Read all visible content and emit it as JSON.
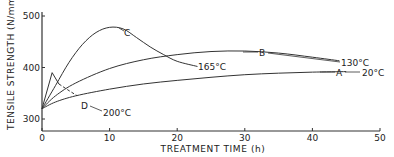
{
  "chart_data": {
    "type": "line",
    "title": "",
    "xlabel": "TREATMENT TIME (h)",
    "ylabel": "TENSILE STRENGTH (N/mm²)",
    "xlim": [
      0,
      50
    ],
    "ylim": [
      275,
      510
    ],
    "x_ticks": [
      0,
      10,
      20,
      30,
      40,
      50
    ],
    "x_tick_labels": [
      "0",
      "10",
      "20",
      "30",
      "40",
      "50"
    ],
    "y_ticks": [
      300,
      400,
      500
    ],
    "y_tick_labels": [
      "300",
      "400",
      "500"
    ],
    "grid": false,
    "legend": "inline labels",
    "series": [
      {
        "name": "A",
        "condition": "20°C",
        "style": "solid",
        "x": [
          0,
          2,
          5,
          10,
          15,
          20,
          25,
          30,
          35,
          40,
          45
        ],
        "y": [
          320,
          333,
          345,
          358,
          368,
          375,
          381,
          386,
          389,
          391,
          392
        ]
      },
      {
        "name": "B",
        "condition": "130°C",
        "style": "solid",
        "x": [
          0,
          2,
          5,
          10,
          15,
          20,
          25,
          30,
          35,
          40,
          44
        ],
        "y": [
          320,
          345,
          370,
          398,
          415,
          425,
          431,
          432,
          428,
          420,
          413
        ]
      },
      {
        "name": "C",
        "condition": "165°C",
        "style": "solid",
        "x": [
          0,
          2,
          4,
          6,
          8,
          10,
          12,
          14,
          16,
          18,
          20,
          23
        ],
        "y": [
          320,
          365,
          410,
          445,
          468,
          478,
          475,
          458,
          440,
          425,
          412,
          402
        ]
      },
      {
        "name": "D",
        "condition": "200°C",
        "style": "solid then dashed",
        "x": [
          0,
          1.5,
          2.5,
          4
        ],
        "y": [
          320,
          390,
          368,
          355
        ]
      }
    ],
    "annotations": [
      {
        "text": "A",
        "target": "series A"
      },
      {
        "text": "20°C",
        "target": "series A end"
      },
      {
        "text": "B",
        "target": "series B"
      },
      {
        "text": "130°C",
        "target": "series B end"
      },
      {
        "text": "C",
        "target": "series C peak"
      },
      {
        "text": "165°C",
        "target": "series C end"
      },
      {
        "text": "D",
        "target": "series D leader"
      },
      {
        "text": "200°C",
        "target": "series D"
      }
    ]
  },
  "labels": {
    "ylabel": "TENSILE STRENGTH (N/mm²)",
    "xlabel": "TREATMENT TIME (h)",
    "A": "A",
    "A_temp": "20°C",
    "B": "B",
    "B_temp": "130°C",
    "C": "C",
    "C_temp": "165°C",
    "D": "D",
    "D_temp": "200°C"
  },
  "style": {
    "line_color": "#333333",
    "text_color": "#222222"
  }
}
